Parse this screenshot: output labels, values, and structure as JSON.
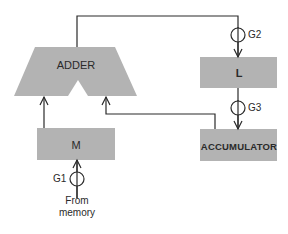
{
  "diagram": {
    "blocks": {
      "adder": "ADDER",
      "l": "L",
      "accumulator": "ACCUMULATOR",
      "m": "M"
    },
    "gates": {
      "g1": "G1",
      "g2": "G2",
      "g3": "G3"
    },
    "source": {
      "line1": "From",
      "line2": "memory"
    },
    "colors": {
      "block_fill": "#b3b3b3",
      "line": "#2a2a2a",
      "background": "#ffffff"
    }
  }
}
